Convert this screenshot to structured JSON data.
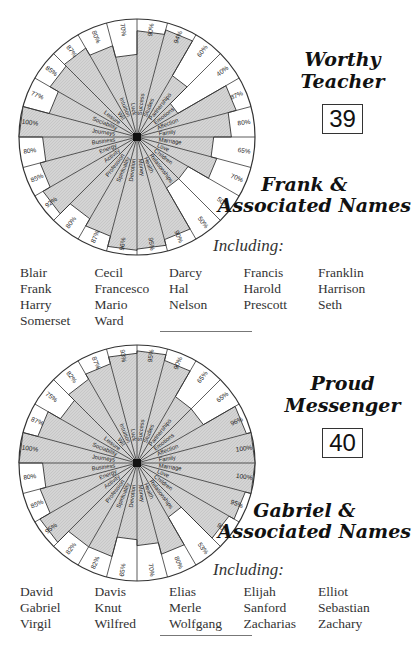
{
  "chart_data": [
    {
      "type": "radar",
      "title": "Worthy Teacher",
      "number": "39",
      "name_group": "Frank & Associated Names",
      "axes": [
        "Success",
        "Studies",
        "Partnerships",
        "Emotions",
        "Affection",
        "Family",
        "Marriage",
        "Love",
        "Children",
        "Relationships",
        "Health",
        "Money",
        "Devotion",
        "Spirituality",
        "Profession",
        "Activity",
        "Energy",
        "Business",
        "Journeys",
        "Sociability",
        "Leisure",
        "Wit",
        "Intuition",
        "Luck"
      ],
      "values": [
        90,
        94,
        60,
        40,
        87,
        80,
        65,
        70,
        50,
        50,
        90,
        95,
        96,
        87,
        80,
        92,
        85,
        80,
        100,
        77,
        85,
        87,
        80,
        70
      ],
      "value_labels": [
        "90%",
        "94%",
        "60%",
        "40%",
        "87%",
        "80%",
        "65%",
        "70%",
        "50%",
        "50%",
        "90%",
        "95%",
        "96%",
        "87%",
        "80%",
        "92%",
        "85%",
        "80%",
        "100%",
        "77%",
        "85%",
        "87%",
        "80%",
        "70%"
      ],
      "range": [
        0,
        100
      ],
      "fill_color": "#cfcfcf"
    },
    {
      "type": "radar",
      "title": "Proud Messenger",
      "number": "40",
      "name_group": "Gabriel & Associated Names",
      "axes": [
        "Success",
        "Studies",
        "Partnerships",
        "Emotions",
        "Affection",
        "Family",
        "Marriage",
        "Love",
        "Children",
        "Relationships",
        "Health",
        "Money",
        "Devotion",
        "Spirituality",
        "Profession",
        "Activity",
        "Energy",
        "Business",
        "Journeys",
        "Sociability",
        "Leisure",
        "Wit",
        "Intuition",
        "Luck"
      ],
      "values": [
        95,
        90,
        65,
        65,
        96,
        100,
        100,
        95,
        90,
        53,
        80,
        70,
        65,
        82,
        82,
        95,
        85,
        80,
        100,
        87,
        75,
        82,
        87,
        93
      ],
      "value_labels": [
        "95%",
        "90%",
        "65%",
        "65%",
        "96%",
        "100%",
        "100%",
        "95%",
        "90%",
        "53%",
        "80%",
        "70%",
        "65%",
        "82%",
        "82%",
        "95%",
        "85%",
        "80%",
        "100%",
        "87%",
        "75%",
        "82%",
        "87%",
        "93%"
      ],
      "range": [
        0,
        100
      ],
      "fill_color": "#cfcfcf"
    }
  ],
  "sections": [
    {
      "title_line1": "Worthy",
      "title_line2": "Teacher",
      "number": "39",
      "names_title_line1": "Frank &",
      "names_title_line2": "Associated Names",
      "including_label": "Including:",
      "names": [
        "Blair",
        "Cecil",
        "Darcy",
        "Francis",
        "Franklin",
        "Frank",
        "Francesco",
        "Hal",
        "Harold",
        "Harrison",
        "Harry",
        "Mario",
        "Nelson",
        "Prescott",
        "Seth",
        "Somerset",
        "Ward"
      ]
    },
    {
      "title_line1": "Proud",
      "title_line2": "Messenger",
      "number": "40",
      "names_title_line1": "Gabriel &",
      "names_title_line2": "Associated Names",
      "including_label": "Including:",
      "names": [
        "David",
        "Davis",
        "Elias",
        "Elijah",
        "Elliot",
        "Gabriel",
        "Knut",
        "Merle",
        "Sanford",
        "Sebastian",
        "Virgil",
        "Wilfred",
        "Wolfgang",
        "Zacharias",
        "Zachary"
      ]
    }
  ]
}
